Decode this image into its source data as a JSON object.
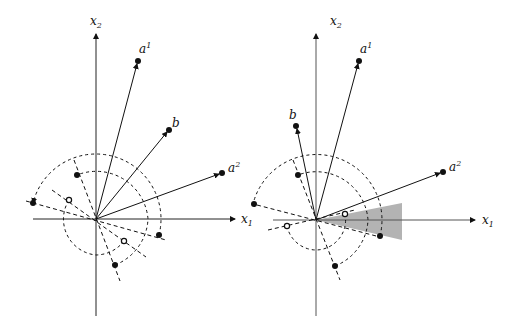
{
  "panels": [
    {
      "id": "left",
      "axes": {
        "x_label": "x",
        "x_sub": "1",
        "y_label": "x",
        "y_sub": "2"
      },
      "vectors": [
        {
          "name": "a",
          "sup": "1"
        },
        {
          "name": "b",
          "sup": ""
        },
        {
          "name": "a",
          "sup": "2"
        }
      ]
    },
    {
      "id": "right",
      "axes": {
        "x_label": "x",
        "x_sub": "1",
        "y_label": "x",
        "y_sub": "2"
      },
      "vectors": [
        {
          "name": "a",
          "sup": "1"
        },
        {
          "name": "b",
          "sup": ""
        },
        {
          "name": "a",
          "sup": "2"
        }
      ],
      "shaded_cone": true
    }
  ],
  "colors": {
    "ink": "#111111",
    "shade": "#b3b3b3"
  }
}
